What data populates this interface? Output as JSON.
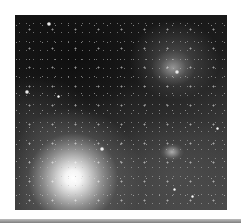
{
  "image": {
    "description": "Grayscale astronomical image of a star field with nebulae",
    "features": [
      {
        "name": "bright-star",
        "x": 73,
        "y": 178
      },
      {
        "name": "upper-right-nebula",
        "x": 173,
        "y": 68
      },
      {
        "name": "lower-right-nebula",
        "x": 172,
        "y": 152
      }
    ]
  },
  "colors": {
    "background": "#ffffff",
    "bottom_bar": "#8a8a8a"
  }
}
